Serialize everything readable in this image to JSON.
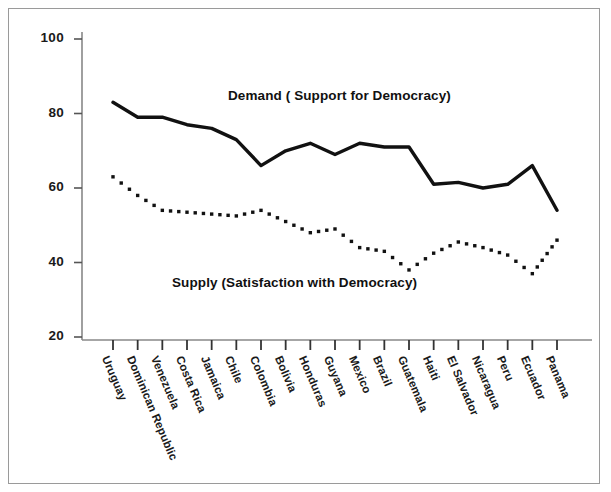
{
  "chart_data": {
    "type": "line",
    "title": "",
    "xlabel": "",
    "ylabel": "",
    "ylim": [
      20,
      100
    ],
    "yticks": [
      20,
      40,
      60,
      80,
      100
    ],
    "grid": false,
    "legend_position": "inline-annotation",
    "categories": [
      "Uruguay",
      "Dominican Republic",
      "Venezuela",
      "Costa Rica",
      "Jamaica",
      "Chile",
      "Colombia",
      "Bolivia",
      "Honduras",
      "Guyana",
      "Mexico",
      "Brazil",
      "Guatemala",
      "Haiti",
      "El Salvador",
      "Nicaragua",
      "Peru",
      "Ecuador",
      "Panama"
    ],
    "series": [
      {
        "name": "Demand ( Support for Democracy)",
        "style": "solid",
        "values": [
          83,
          79,
          79,
          77,
          76,
          73,
          66,
          70,
          72,
          69,
          72,
          71,
          71,
          61,
          61.5,
          60,
          61,
          66,
          54
        ]
      },
      {
        "name": "Supply (Satisfaction with Democracy)",
        "style": "dotted",
        "values": [
          63,
          58,
          54,
          53.5,
          53,
          52.5,
          54,
          51,
          48,
          49,
          44,
          43,
          38,
          42.5,
          45.5,
          44,
          42,
          37,
          46
        ]
      }
    ],
    "annotations": [
      {
        "id": "demand-label",
        "text": "Demand ( Support for Democracy)"
      },
      {
        "id": "supply-label",
        "text": "Supply (Satisfaction with Democracy)"
      }
    ]
  },
  "axis": {
    "y_tick_labels": [
      "100",
      "80",
      "60",
      "40",
      "20"
    ]
  },
  "colors": {
    "line": "#111111",
    "axis": "#888888",
    "frame": "#9a9a9a",
    "text": "#1a1a1a",
    "background": "#ffffff"
  }
}
